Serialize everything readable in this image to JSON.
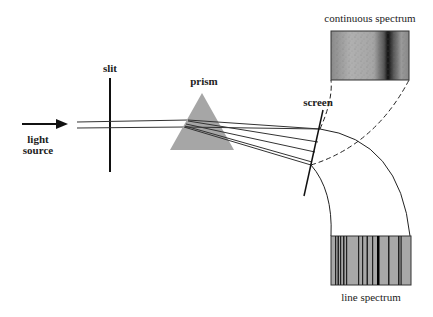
{
  "diagram": {
    "labels": {
      "light_source_line1": "light",
      "light_source_line2": "source",
      "slit": "slit",
      "prism": "prism",
      "screen": "screen",
      "continuous_spectrum": "continuous spectrum",
      "line_spectrum": "line spectrum"
    },
    "colors": {
      "prism": "#a6a6a6",
      "lines": "#222222",
      "spectrum_base": "#a8a8a8",
      "spectrum_dark": "#111111"
    },
    "nodes": [
      {
        "id": "light-source",
        "label": "light source"
      },
      {
        "id": "slit",
        "label": "slit"
      },
      {
        "id": "prism",
        "label": "prism"
      },
      {
        "id": "screen",
        "label": "screen"
      },
      {
        "id": "continuous-spectrum",
        "label": "continuous spectrum"
      },
      {
        "id": "line-spectrum",
        "label": "line spectrum"
      }
    ],
    "edges": [
      {
        "from": "light-source",
        "to": "slit",
        "type": "arrow"
      },
      {
        "from": "slit",
        "to": "prism",
        "type": "beam"
      },
      {
        "from": "prism",
        "to": "screen",
        "type": "dispersed-rays",
        "count": 5
      },
      {
        "from": "screen",
        "to": "continuous-spectrum",
        "type": "dashed-projection"
      },
      {
        "from": "screen",
        "to": "line-spectrum",
        "type": "solid-projection"
      }
    ]
  }
}
